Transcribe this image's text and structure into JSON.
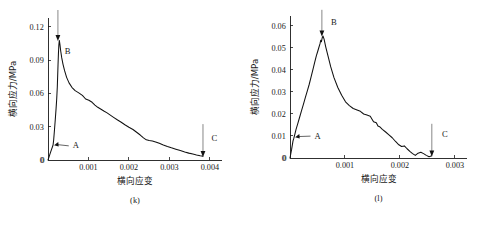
{
  "figure": {
    "background_color": "#ffffff",
    "line_color": "#111111",
    "text_color": "#1a1a1a",
    "panel_count": 2
  },
  "chart_data": [
    {
      "type": "line",
      "panel_id": "k",
      "caption": "(k)",
      "title": "",
      "xlabel": "横向应变",
      "ylabel": "横向应力/MPa",
      "xlim": [
        0,
        0.0043
      ],
      "ylim": [
        0,
        0.128
      ],
      "xticks": [
        0,
        0.001,
        0.002,
        0.003,
        0.004
      ],
      "xticklabels": [
        "0",
        "0.001",
        "0.002",
        "0.003",
        "0.004"
      ],
      "yticks": [
        0,
        0.03,
        0.06,
        0.09,
        0.12
      ],
      "yticklabels": [
        "0",
        "0.03",
        "0.06",
        "0.09",
        "0.12"
      ],
      "grid": false,
      "legend": false,
      "annotations": [
        {
          "label": "A",
          "x": 0.000125,
          "y": 0.0135,
          "kind": "leader-arrow",
          "text_x": 0.00055,
          "text_y": 0.0105
        },
        {
          "label": "B",
          "x": 0.000245,
          "y": 0.108,
          "kind": "down-arrow",
          "text_x": 0.00035,
          "text_y": 0.0955
        },
        {
          "label": "C",
          "x": 0.00383,
          "y": 0.0035,
          "kind": "down-arrow",
          "text_x": 0.00398,
          "text_y": 0.0175
        }
      ],
      "x": [
        0.0,
        3e-05,
        6e-05,
        9e-05,
        0.000115,
        0.000125,
        0.00014,
        0.00016,
        0.00018,
        0.0002,
        0.000215,
        0.00023,
        0.00024,
        0.000248,
        0.000258,
        0.000268,
        0.00028,
        0.000295,
        0.000315,
        0.00034,
        0.00037,
        0.00041,
        0.00046,
        0.00052,
        0.00059,
        0.00067,
        0.00076,
        0.00085,
        0.00093,
        0.00101,
        0.00109,
        0.00116,
        0.00123,
        0.0013,
        0.00138,
        0.00146,
        0.00154,
        0.00163,
        0.00172,
        0.00181,
        0.0019,
        0.002,
        0.0021,
        0.00219,
        0.00228,
        0.00236,
        0.00243,
        0.0025,
        0.00258,
        0.00266,
        0.00275,
        0.00285,
        0.00295,
        0.00305,
        0.00316,
        0.00327,
        0.00338,
        0.00348,
        0.00358,
        0.00367,
        0.00376,
        0.00383
      ],
      "y": [
        0.0,
        0.0032,
        0.0066,
        0.0098,
        0.0124,
        0.0135,
        0.018,
        0.027,
        0.0365,
        0.0465,
        0.055,
        0.066,
        0.077,
        0.086,
        0.096,
        0.1035,
        0.1078,
        0.104,
        0.098,
        0.092,
        0.0865,
        0.0805,
        0.0745,
        0.0695,
        0.0655,
        0.0625,
        0.0605,
        0.0582,
        0.055,
        0.0538,
        0.052,
        0.0495,
        0.0475,
        0.046,
        0.0442,
        0.0425,
        0.0405,
        0.0382,
        0.036,
        0.034,
        0.0318,
        0.0295,
        0.0275,
        0.025,
        0.0225,
        0.02,
        0.0182,
        0.0175,
        0.0172,
        0.0163,
        0.015,
        0.0135,
        0.0122,
        0.011,
        0.0098,
        0.0085,
        0.0072,
        0.0062,
        0.0054,
        0.0046,
        0.0039,
        0.0035
      ]
    },
    {
      "type": "line",
      "panel_id": "l",
      "caption": "(l)",
      "title": "",
      "xlabel": "横向应变",
      "ylabel": "横向应力/MPa",
      "xlim": [
        0,
        0.00322
      ],
      "ylim": [
        0,
        0.0645
      ],
      "xticks": [
        0,
        0.001,
        0.002,
        0.003
      ],
      "xticklabels": [
        "0",
        "0.001",
        "0.002",
        "0.003"
      ],
      "yticks": [
        0,
        0.01,
        0.02,
        0.03,
        0.04,
        0.05,
        0.06
      ],
      "yticklabels": [
        "0",
        "0.01",
        "0.02",
        "0.03",
        "0.04",
        "0.05",
        "0.06"
      ],
      "grid": false,
      "legend": false,
      "annotations": [
        {
          "label": "A",
          "x": 7.5e-05,
          "y": 0.0095,
          "kind": "leader-arrow",
          "text_x": 0.0004,
          "text_y": 0.0088
        },
        {
          "label": "B",
          "x": 0.00058,
          "y": 0.0555,
          "kind": "down-arrow",
          "text_x": 0.0007,
          "text_y": 0.0605
        },
        {
          "label": "C",
          "x": 0.00258,
          "y": 0.001,
          "kind": "down-arrow",
          "text_x": 0.00272,
          "text_y": 0.0095
        }
      ],
      "x": [
        0.0,
        3e-05,
        5.5e-05,
        7e-05,
        7.5e-05,
        9e-05,
        0.00011,
        0.00014,
        0.000175,
        0.00021,
        0.000245,
        0.00028,
        0.000315,
        0.00035,
        0.000385,
        0.00042,
        0.00045,
        0.00048,
        0.000505,
        0.000525,
        0.000545,
        0.00056,
        0.000572,
        0.000585,
        0.0006,
        0.00062,
        0.00065,
        0.00069,
        0.00074,
        0.0008,
        0.00087,
        0.00094,
        0.00101,
        0.00108,
        0.00115,
        0.00122,
        0.00128,
        0.00134,
        0.0014,
        0.00146,
        0.00152,
        0.00157,
        0.0016,
        0.00163,
        0.00168,
        0.00174,
        0.0018,
        0.00186,
        0.00192,
        0.00198,
        0.00203,
        0.00208,
        0.00213,
        0.00218,
        0.00223,
        0.00228,
        0.00233,
        0.00238,
        0.00243,
        0.00248,
        0.00253,
        0.00258
      ],
      "y": [
        0.0,
        0.004,
        0.0078,
        0.009,
        0.0095,
        0.011,
        0.013,
        0.0155,
        0.0185,
        0.0215,
        0.0245,
        0.0275,
        0.0305,
        0.0335,
        0.037,
        0.0405,
        0.0435,
        0.0465,
        0.0485,
        0.0502,
        0.0518,
        0.0535,
        0.0528,
        0.0545,
        0.0554,
        0.054,
        0.0505,
        0.0465,
        0.0415,
        0.0365,
        0.032,
        0.0285,
        0.0255,
        0.0238,
        0.0225,
        0.0218,
        0.0212,
        0.02,
        0.0195,
        0.019,
        0.0165,
        0.016,
        0.0145,
        0.0142,
        0.013,
        0.0118,
        0.0105,
        0.0092,
        0.0075,
        0.006,
        0.0052,
        0.0055,
        0.0042,
        0.003,
        0.002,
        0.0012,
        0.0022,
        0.0026,
        0.002,
        0.0012,
        0.0006,
        0.001
      ]
    }
  ]
}
